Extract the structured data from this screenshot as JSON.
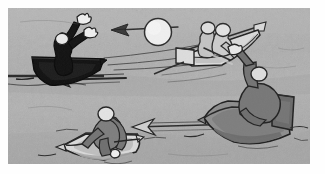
{
  "scene": {
    "title": "Four rowboats on gray water passing a ball",
    "medium": "hand-drawn cartoon illustration, pencil / wash on textured paper",
    "canvas": {
      "width": 325,
      "height": 174,
      "frame_x": 8,
      "frame_y": 8,
      "frame_width": 302,
      "frame_height": 156
    },
    "palette": {
      "paper": "#fdfdfd",
      "water_light": "#b4b4b4",
      "water_mid": "#a8a8a8",
      "water_dark": "#9b9b9b",
      "ink": "#2b2b2b",
      "ink_soft": "#4a4a4a",
      "dark_silhouette": "#151515",
      "mid_gray_fill": "#6f6f6f",
      "boat_gray_fill": "#8a8a8a",
      "light_fill": "#dadada",
      "highlight_white": "#f2f2f2"
    },
    "description": "A textured gray water field fills the framed panel. Four small rowboats sit at different depths. Motion arrows and wake lines show a pale ball being thrown leftward across the scene."
  },
  "elements": {
    "boat_dark": {
      "name": "dark boat, upper left",
      "hull_tone": "dark_silhouette",
      "figure": "dark silhouette figure with pale round head and two pale raised hands, arms thrown up",
      "pose": "both arms raised overhead, leaning back",
      "wake": "horizontal dark water line running left off frame"
    },
    "boat_white_upper": {
      "name": "pale boat, upper right",
      "hull_tone": "light_fill",
      "figure": "two pale gray figures seated close together, front one bent forward",
      "pose": "rowing / leaning forward over the gunwale",
      "oar": "long pale oar angled up-right past the bow"
    },
    "boat_gray_right": {
      "name": "gray boat, right",
      "hull_tone": "boat_gray_fill",
      "figure": "mid-gray figure with pale head, one arm stretched up and back",
      "pose": "arm extended upward gripping a pole, pale mitten hand",
      "detail": "darker seat / transom block at the stern"
    },
    "boat_white_lower": {
      "name": "pale boat, lower left",
      "hull_tone": "light_fill",
      "figure": "mid-gray figure with pale round head hunched forward, pale hand on the oar",
      "pose": "hunched over the oars, pulling",
      "wake": "long arrowed wake trailing to the right"
    },
    "ball": {
      "name": "pale ball in flight",
      "tone": "highlight_white",
      "position": "upper middle of the panel, above the water line"
    },
    "arrows": [
      {
        "id": "arrow-top",
        "direction": "left",
        "note": "flight path of the ball toward upper left"
      },
      {
        "id": "arrow-mid",
        "direction": "left",
        "note": "motion toward the dark boat"
      },
      {
        "id": "arrow-lower",
        "direction": "left",
        "note": "motion toward the lower pale boat"
      }
    ]
  }
}
